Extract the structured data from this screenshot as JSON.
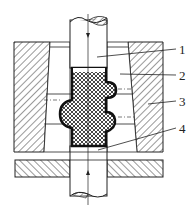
{
  "diagram": {
    "type": "mechanical-cross-section",
    "labels": [
      {
        "id": "1",
        "text": "1"
      },
      {
        "id": "2",
        "text": "2"
      },
      {
        "id": "3",
        "text": "3"
      },
      {
        "id": "4",
        "text": "4"
      }
    ],
    "colors": {
      "line": "#222222",
      "background": "#ffffff"
    }
  }
}
